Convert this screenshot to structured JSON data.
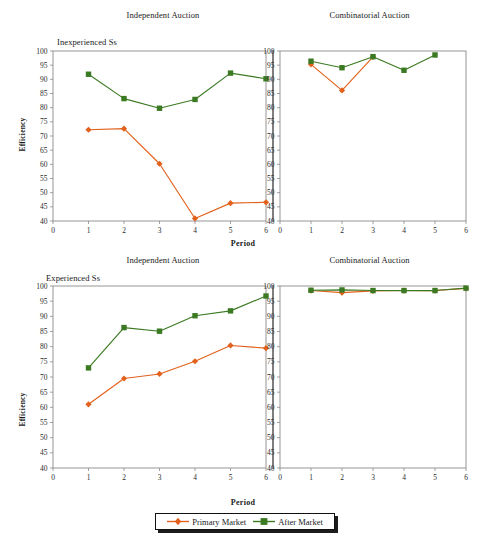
{
  "figure": {
    "xlabel": "Period",
    "ylabel": "Efficiency",
    "panel_titles": {
      "independent": "Independent Auction",
      "combinatorial": "Combinatorial Auction"
    },
    "subtitles": {
      "top": "Inexperienced Ss",
      "bottom": "Experienced Ss"
    },
    "legend": {
      "primary": "Primary Market",
      "after": "After Market"
    },
    "colors": {
      "primary_market": "#E2611C",
      "after_market": "#3B7A23",
      "axis": "#8a8a8a",
      "divider": "#3a3a3a",
      "text": "#1a1a1a"
    },
    "yticks": [
      "40",
      "45",
      "50",
      "55",
      "60",
      "65",
      "70",
      "75",
      "80",
      "85",
      "90",
      "95",
      "100"
    ],
    "xticks": [
      "0",
      "1",
      "2",
      "3",
      "4",
      "5",
      "6"
    ]
  },
  "chart_data": [
    {
      "type": "line",
      "title": "Independent Auction",
      "subtitle": "Inexperienced Ss",
      "panel": "top-left",
      "xlabel": "Period",
      "ylabel": "Efficiency",
      "xlim": [
        0,
        6
      ],
      "ylim": [
        40,
        100
      ],
      "grid": false,
      "legend_position": "bottom-center",
      "x": [
        1,
        2,
        3,
        4,
        5,
        6
      ],
      "series": [
        {
          "name": "Primary Market",
          "marker": "diamond",
          "color": "#E2611C",
          "values": [
            72.2,
            72.6,
            60.2,
            40.9,
            46.3,
            46.6
          ]
        },
        {
          "name": "After Market",
          "marker": "square",
          "color": "#3B7A23",
          "values": [
            91.8,
            83.2,
            79.8,
            82.9,
            92.2,
            90.2
          ]
        }
      ]
    },
    {
      "type": "line",
      "title": "Combinatorial Auction",
      "subtitle": "Inexperienced Ss",
      "panel": "top-right",
      "xlabel": "Period",
      "ylabel": "Efficiency",
      "xlim": [
        0,
        6
      ],
      "ylim": [
        40,
        100
      ],
      "grid": false,
      "legend_position": "bottom-center",
      "x": [
        1,
        2,
        3,
        4,
        5
      ],
      "series": [
        {
          "name": "Primary Market",
          "marker": "diamond",
          "color": "#E2611C",
          "values": [
            95.3,
            86.1,
            97.9,
            null,
            null
          ]
        },
        {
          "name": "After Market",
          "marker": "square",
          "color": "#3B7A23",
          "values": [
            96.4,
            94.1,
            98.0,
            93.2,
            98.6
          ]
        }
      ]
    },
    {
      "type": "line",
      "title": "Independent Auction",
      "subtitle": "Experienced Ss",
      "panel": "bottom-left",
      "xlabel": "Period",
      "ylabel": "Efficiency",
      "xlim": [
        0,
        6
      ],
      "ylim": [
        40,
        100
      ],
      "grid": false,
      "legend_position": "bottom-center",
      "x": [
        1,
        2,
        3,
        4,
        5,
        6
      ],
      "series": [
        {
          "name": "Primary Market",
          "marker": "diamond",
          "color": "#E2611C",
          "values": [
            61.0,
            69.5,
            71.0,
            75.2,
            80.4,
            79.5
          ]
        },
        {
          "name": "After Market",
          "marker": "square",
          "color": "#3B7A23",
          "values": [
            73.0,
            86.3,
            85.1,
            90.2,
            91.8,
            96.7
          ]
        }
      ]
    },
    {
      "type": "line",
      "title": "Combinatorial Auction",
      "subtitle": "Experienced Ss",
      "panel": "bottom-right",
      "xlabel": "Period",
      "ylabel": "Efficiency",
      "xlim": [
        0,
        6
      ],
      "ylim": [
        40,
        100
      ],
      "grid": false,
      "legend_position": "bottom-center",
      "x": [
        1,
        2,
        3,
        4,
        5,
        6
      ],
      "series": [
        {
          "name": "Primary Market",
          "marker": "diamond",
          "color": "#E2611C",
          "values": [
            98.5,
            97.8,
            98.4,
            98.5,
            98.5,
            99.2
          ]
        },
        {
          "name": "After Market",
          "marker": "square",
          "color": "#3B7A23",
          "values": [
            98.6,
            98.7,
            98.5,
            98.5,
            98.5,
            99.3
          ]
        }
      ]
    }
  ]
}
